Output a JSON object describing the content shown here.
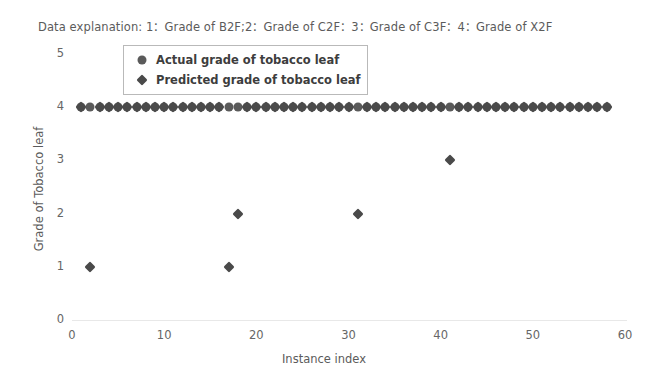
{
  "caption": "Data explanation: 1：Grade of B2F;2：Grade of C2F：3：Grade of C3F：4：Grade of X2F",
  "legend": {
    "items": [
      {
        "label": "Actual grade of tobacco leaf",
        "marker": "circle-marker",
        "color": "#5a5a5a"
      },
      {
        "label": "Predicted grade of tobacco leaf",
        "marker": "diamond-marker",
        "color": "#4a4a4a"
      }
    ]
  },
  "axes": {
    "x_title": "Instance index",
    "y_title": "Grade of Tobacco leaf",
    "x_ticks": [
      "0",
      "10",
      "20",
      "30",
      "40",
      "50",
      "60"
    ],
    "y_ticks": [
      "5",
      "4",
      "3",
      "2",
      "1",
      "0"
    ]
  },
  "chart_data": {
    "type": "scatter",
    "title": "Data explanation: 1：Grade of B2F;2：Grade of C2F：3：Grade of C3F：4：Grade of X2F",
    "xlabel": "Instance index",
    "ylabel": "Grade of Tobacco leaf",
    "xlim": [
      0,
      60
    ],
    "ylim": [
      0,
      5
    ],
    "xticks": [
      0,
      10,
      20,
      30,
      40,
      50,
      60
    ],
    "yticks": [
      0,
      1,
      2,
      3,
      4,
      5
    ],
    "grid": false,
    "legend_position": "upper-left-inside",
    "grade_legend": {
      "1": "Grade of B2F",
      "2": "Grade of C2F",
      "3": "Grade of C3F",
      "4": "Grade of X2F"
    },
    "x": [
      1,
      2,
      3,
      4,
      5,
      6,
      7,
      8,
      9,
      10,
      11,
      12,
      13,
      14,
      15,
      16,
      17,
      18,
      19,
      20,
      21,
      22,
      23,
      24,
      25,
      26,
      27,
      28,
      29,
      30,
      31,
      32,
      33,
      34,
      35,
      36,
      37,
      38,
      39,
      40,
      41,
      42,
      43,
      44,
      45,
      46,
      47,
      48,
      49,
      50,
      51,
      52,
      53,
      54,
      55,
      56,
      57,
      58
    ],
    "series": [
      {
        "name": "Actual grade of tobacco leaf",
        "marker": "circle",
        "color": "#5a5a5a",
        "values": [
          4,
          4,
          4,
          4,
          4,
          4,
          4,
          4,
          4,
          4,
          4,
          4,
          4,
          4,
          4,
          4,
          4,
          4,
          4,
          4,
          4,
          4,
          4,
          4,
          4,
          4,
          4,
          4,
          4,
          4,
          4,
          4,
          4,
          4,
          4,
          4,
          4,
          4,
          4,
          4,
          4,
          4,
          4,
          4,
          4,
          4,
          4,
          4,
          4,
          4,
          4,
          4,
          4,
          4,
          4,
          4,
          4,
          4
        ]
      },
      {
        "name": "Predicted grade of tobacco leaf",
        "marker": "diamond",
        "color": "#4a4a4a",
        "values": [
          4,
          1,
          4,
          4,
          4,
          4,
          4,
          4,
          4,
          4,
          4,
          4,
          4,
          4,
          4,
          4,
          1,
          2,
          4,
          4,
          4,
          4,
          4,
          4,
          4,
          4,
          4,
          4,
          4,
          4,
          2,
          4,
          4,
          4,
          4,
          4,
          4,
          4,
          4,
          4,
          3,
          4,
          4,
          4,
          4,
          4,
          4,
          4,
          4,
          4,
          4,
          4,
          4,
          4,
          4,
          4,
          4,
          4
        ]
      }
    ],
    "misclassified_instances": [
      {
        "index": 2,
        "actual": 4,
        "predicted": 1
      },
      {
        "index": 17,
        "actual": 4,
        "predicted": 1
      },
      {
        "index": 18,
        "actual": 4,
        "predicted": 2
      },
      {
        "index": 31,
        "actual": 4,
        "predicted": 2
      },
      {
        "index": 41,
        "actual": 4,
        "predicted": 3
      }
    ]
  }
}
